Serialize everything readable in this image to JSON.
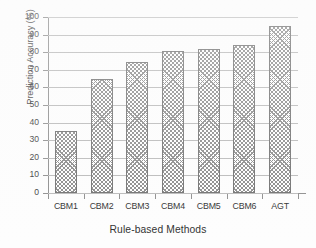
{
  "chart_data": {
    "type": "bar",
    "title": "",
    "xlabel": "Rule-based Methods",
    "ylabel": "Prediction Accuracy (%)",
    "categories": [
      "CBM1",
      "CBM2",
      "CBM3",
      "CBM4",
      "CBM5",
      "CBM6",
      "AGT"
    ],
    "values": [
      35.5,
      64.5,
      74.5,
      80.5,
      82,
      84,
      95
    ],
    "ylim": [
      0,
      100
    ],
    "ytick_labels": [
      "0",
      "10",
      "20",
      "30",
      "40",
      "50",
      "60",
      "70",
      "80",
      "90",
      "100"
    ],
    "ytick_values": [
      0,
      10,
      20,
      30,
      40,
      50,
      60,
      70,
      80,
      90,
      100
    ],
    "grid": "horizontal",
    "legend": "none",
    "series": [
      {
        "name": "Prediction Accuracy",
        "values": [
          35.5,
          64.5,
          74.5,
          80.5,
          82,
          84,
          95
        ]
      }
    ],
    "colors": {
      "bar_fill": "#ffffff",
      "bar_hatch": "#8a8a8a",
      "bar_border": "#6f6f6f",
      "gridline": "#b9b9b9",
      "axis": "#8d8d8d",
      "text": "#2f2f2f",
      "background": "#fdfdfd"
    }
  }
}
